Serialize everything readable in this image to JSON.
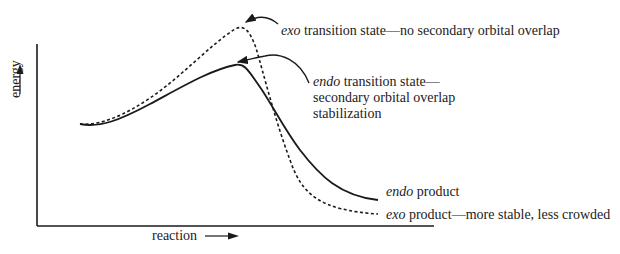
{
  "diagram": {
    "type": "reaction-energy-profile",
    "axes": {
      "x_label": "reaction",
      "y_label": "energy"
    },
    "curves": [
      {
        "name": "endo",
        "style": "solid"
      },
      {
        "name": "exo",
        "style": "dashed"
      }
    ],
    "annotations": {
      "exo_ts": {
        "italic": "exo",
        "text": " transition state—no secondary orbital overlap"
      },
      "endo_ts": {
        "italic": "endo",
        "line1": " transition state—",
        "line2": "secondary orbital overlap",
        "line3": "stabilization"
      },
      "endo_product": {
        "italic": "endo",
        "text": " product"
      },
      "exo_product": {
        "italic": "exo",
        "text": " product—more stable, less crowded"
      }
    },
    "colors": {
      "ink": "#1a1a1a",
      "background": "#ffffff"
    }
  }
}
